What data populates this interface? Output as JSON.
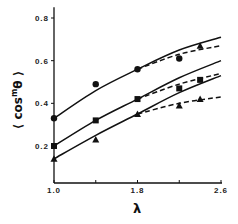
{
  "chart_data": {
    "type": "line",
    "title": "",
    "xlabel": "λ",
    "ylabel": "⟨cos^m θ⟩",
    "ylabel_parts": {
      "left": "⟨",
      "base": "cos",
      "sup": "m",
      "theta": "θ",
      "right": "⟩"
    },
    "xlim": [
      1.0,
      2.6
    ],
    "ylim": [
      0.03,
      0.85
    ],
    "x_ticks": [
      1.0,
      1.4,
      1.8,
      2.2,
      2.6
    ],
    "x_tick_labels": [
      "1.0",
      "",
      "1.8",
      "",
      "2.6"
    ],
    "y_ticks": [
      0.2,
      0.4,
      0.6,
      0.8
    ],
    "y_tick_labels": [
      "0.2",
      "0.4",
      "0.6",
      "0.8"
    ],
    "grid": false,
    "legend": null,
    "series": [
      {
        "name": "circles",
        "marker": "circle",
        "x": [
          1.0,
          1.4,
          1.8,
          2.2
        ],
        "values": [
          0.33,
          0.49,
          0.56,
          0.61
        ]
      },
      {
        "name": "squares",
        "marker": "square",
        "x": [
          1.0,
          1.4,
          1.8,
          2.2,
          2.4
        ],
        "values": [
          0.2,
          0.32,
          0.42,
          0.47,
          0.51
        ]
      },
      {
        "name": "triangles",
        "marker": "triangle",
        "x": [
          1.0,
          1.4,
          1.8,
          2.2,
          2.4
        ],
        "values": [
          0.14,
          0.23,
          0.35,
          0.39,
          0.42
        ]
      },
      {
        "name": "circles-extra",
        "marker": "triangle",
        "x": [
          2.4
        ],
        "values": [
          0.67
        ]
      }
    ],
    "curves": [
      {
        "name": "upper-solid",
        "style": "solid",
        "x": [
          1.0,
          1.4,
          1.8,
          2.2,
          2.6
        ],
        "values": [
          0.33,
          0.46,
          0.56,
          0.65,
          0.71
        ]
      },
      {
        "name": "upper-dashed",
        "style": "dashed",
        "x": [
          1.8,
          2.2,
          2.6
        ],
        "values": [
          0.56,
          0.63,
          0.67
        ]
      },
      {
        "name": "middle-solid",
        "style": "solid",
        "x": [
          1.0,
          1.4,
          1.8,
          2.2,
          2.6
        ],
        "values": [
          0.2,
          0.32,
          0.42,
          0.52,
          0.6
        ]
      },
      {
        "name": "middle-dashed",
        "style": "dashed",
        "x": [
          1.8,
          2.2,
          2.6
        ],
        "values": [
          0.42,
          0.49,
          0.54
        ]
      },
      {
        "name": "lower-solid",
        "style": "solid",
        "x": [
          1.0,
          1.4,
          1.8,
          2.2,
          2.6
        ],
        "values": [
          0.14,
          0.25,
          0.35,
          0.45,
          0.53
        ]
      },
      {
        "name": "lower-dashed",
        "style": "dashed",
        "x": [
          1.8,
          2.2,
          2.6
        ],
        "values": [
          0.35,
          0.4,
          0.43
        ]
      }
    ]
  }
}
